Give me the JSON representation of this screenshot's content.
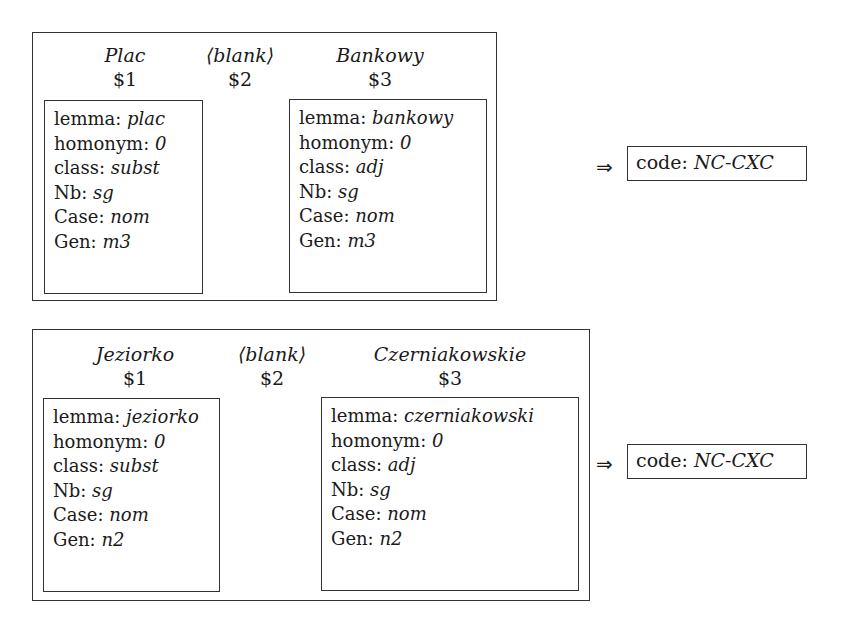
{
  "rules": [
    {
      "tokens": [
        {
          "word": "Plac",
          "var": "$1"
        },
        {
          "word": "⟨blank⟩",
          "var": "$2"
        },
        {
          "word": "Bankowy",
          "var": "$3"
        }
      ],
      "fs1": [
        {
          "key": "lemma:",
          "val": "plac"
        },
        {
          "key": "homonym:",
          "val": "0"
        },
        {
          "key": "class:",
          "val": "subst"
        },
        {
          "key": "Nb:",
          "val": "sg"
        },
        {
          "key": "Case:",
          "val": "nom"
        },
        {
          "key": "Gen:",
          "val": "m3"
        }
      ],
      "fs3": [
        {
          "key": "lemma:",
          "val": "bankowy"
        },
        {
          "key": "homonym:",
          "val": "0"
        },
        {
          "key": "class:",
          "val": "adj"
        },
        {
          "key": "Nb:",
          "val": "sg"
        },
        {
          "key": "Case:",
          "val": "nom"
        },
        {
          "key": "Gen:",
          "val": "m3"
        }
      ],
      "arrow": "⇒",
      "result": {
        "key": "code:",
        "val": "NC-CXC"
      }
    },
    {
      "tokens": [
        {
          "word": "Jeziorko",
          "var": "$1"
        },
        {
          "word": "⟨blank⟩",
          "var": "$2"
        },
        {
          "word": "Czerniakowskie",
          "var": "$3"
        }
      ],
      "fs1": [
        {
          "key": "lemma:",
          "val": "jeziorko"
        },
        {
          "key": "homonym:",
          "val": "0"
        },
        {
          "key": "class:",
          "val": "subst"
        },
        {
          "key": "Nb:",
          "val": "sg"
        },
        {
          "key": "Case:",
          "val": "nom"
        },
        {
          "key": "Gen:",
          "val": "n2"
        }
      ],
      "fs3": [
        {
          "key": "lemma:",
          "val": "czerniakowski"
        },
        {
          "key": "homonym:",
          "val": "0"
        },
        {
          "key": "class:",
          "val": "adj"
        },
        {
          "key": "Nb:",
          "val": "sg"
        },
        {
          "key": "Case:",
          "val": "nom"
        },
        {
          "key": "Gen:",
          "val": "n2"
        }
      ],
      "arrow": "⇒",
      "result": {
        "key": "code:",
        "val": "NC-CXC"
      }
    }
  ]
}
